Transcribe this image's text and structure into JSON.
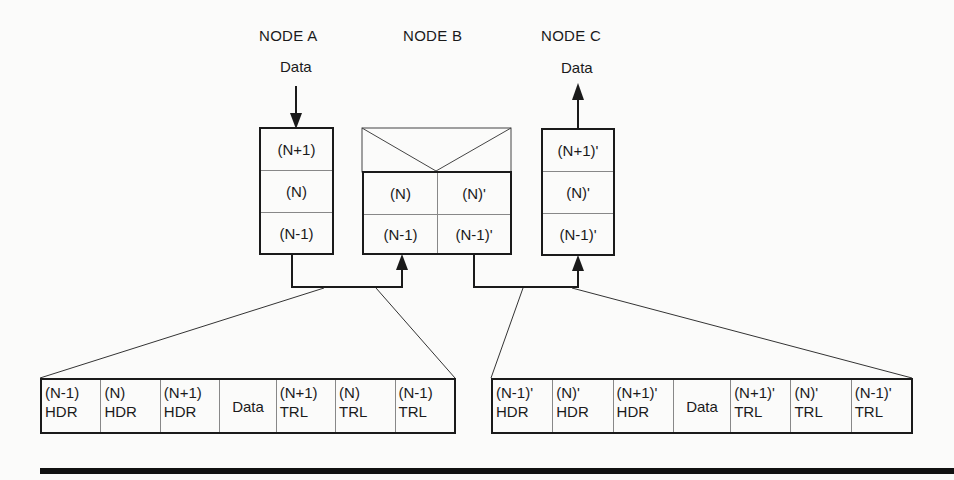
{
  "nodes": {
    "a": {
      "title": "NODE A",
      "data_label": "Data",
      "data_direction": "down",
      "layers": [
        "(N+1)",
        "(N)",
        "(N-1)"
      ]
    },
    "b": {
      "title": "NODE B",
      "layers_left": [
        "(N)",
        "(N-1)"
      ],
      "layers_right": [
        "(N)'",
        "(N-1)'"
      ]
    },
    "c": {
      "title": "NODE C",
      "data_label": "Data",
      "data_direction": "up",
      "layers": [
        "(N+1)'",
        "(N)'",
        "(N-1)'"
      ]
    }
  },
  "packets": {
    "left": {
      "cells": [
        {
          "top": "(N-1)",
          "bottom": "HDR"
        },
        {
          "top": "(N)",
          "bottom": "HDR"
        },
        {
          "top": "(N+1)",
          "bottom": "HDR"
        },
        {
          "top": "Data",
          "bottom": ""
        },
        {
          "top": "(N+1)",
          "bottom": "TRL"
        },
        {
          "top": "(N)",
          "bottom": "TRL"
        },
        {
          "top": "(N-1)",
          "bottom": "TRL"
        }
      ]
    },
    "right": {
      "cells": [
        {
          "top": "(N-1)'",
          "bottom": "HDR"
        },
        {
          "top": "(N)'",
          "bottom": "HDR"
        },
        {
          "top": "(N+1)'",
          "bottom": "HDR"
        },
        {
          "top": "Data",
          "bottom": ""
        },
        {
          "top": "(N+1)'",
          "bottom": "TRL"
        },
        {
          "top": "(N)'",
          "bottom": "TRL"
        },
        {
          "top": "(N-1)'",
          "bottom": "TRL"
        }
      ]
    }
  },
  "colors": {
    "line": "#1a1a1a",
    "divider": "#888888",
    "background": "#fbfbfa"
  }
}
